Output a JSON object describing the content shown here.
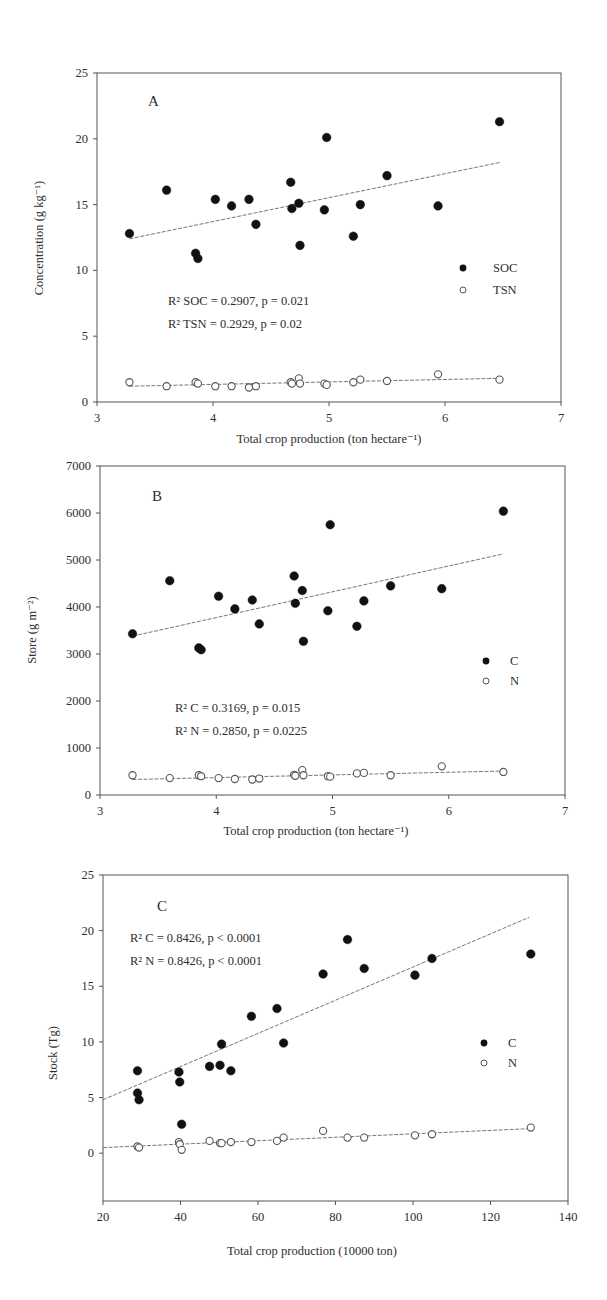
{
  "chart_data": [
    {
      "type": "scatter",
      "panel": "A",
      "title": "",
      "xlabel": "Total crop production (ton hectare⁻¹)",
      "ylabel": "Concentration (g kg⁻¹)",
      "xlim": [
        3,
        7
      ],
      "ylim": [
        0,
        25
      ],
      "xticks": [
        3,
        4,
        5,
        6,
        7
      ],
      "yticks": [
        0,
        5,
        10,
        15,
        20,
        25
      ],
      "grid": false,
      "legend_position": "right-middle",
      "annotations": [
        "R² SOC = 0.2907, p = 0.021",
        "R² TSN = 0.2929, p = 0.02"
      ],
      "series": [
        {
          "name": "SOC",
          "marker": "filled-circle",
          "x": [
            3.28,
            3.6,
            3.85,
            3.87,
            4.02,
            4.16,
            4.31,
            4.37,
            4.67,
            4.68,
            4.74,
            4.75,
            4.96,
            4.98,
            5.21,
            5.27,
            5.5,
            5.94,
            6.47
          ],
          "y": [
            12.8,
            16.1,
            11.3,
            10.9,
            15.4,
            14.9,
            15.4,
            13.5,
            16.7,
            14.7,
            15.1,
            11.9,
            14.6,
            20.1,
            12.6,
            15.0,
            17.2,
            14.9,
            21.3
          ],
          "trendline": {
            "x": [
              3.28,
              6.47
            ],
            "y": [
              12.4,
              18.2
            ]
          }
        },
        {
          "name": "TSN",
          "marker": "open-circle",
          "x": [
            3.28,
            3.6,
            3.85,
            3.87,
            4.02,
            4.16,
            4.31,
            4.37,
            4.67,
            4.68,
            4.74,
            4.75,
            4.96,
            4.98,
            5.21,
            5.27,
            5.5,
            5.94,
            6.47
          ],
          "y": [
            1.5,
            1.2,
            1.5,
            1.4,
            1.2,
            1.2,
            1.1,
            1.2,
            1.5,
            1.4,
            1.8,
            1.4,
            1.4,
            1.3,
            1.5,
            1.7,
            1.6,
            2.1,
            1.7
          ],
          "trendline": {
            "x": [
              3.28,
              6.47
            ],
            "y": [
              1.2,
              1.8
            ]
          }
        }
      ]
    },
    {
      "type": "scatter",
      "panel": "B",
      "title": "",
      "xlabel": "Total crop production (ton hectare⁻¹)",
      "ylabel": "Store (g m⁻²)",
      "xlim": [
        3,
        7
      ],
      "ylim": [
        0,
        7000
      ],
      "xticks": [
        3,
        4,
        5,
        6,
        7
      ],
      "yticks": [
        0,
        1000,
        2000,
        3000,
        4000,
        5000,
        6000,
        7000
      ],
      "grid": false,
      "legend_position": "right-middle",
      "annotations": [
        "R² C = 0.3169, p = 0.015",
        "R² N = 0.2850, p = 0.0225"
      ],
      "series": [
        {
          "name": "C",
          "marker": "filled-circle",
          "x": [
            3.28,
            3.6,
            3.85,
            3.87,
            4.02,
            4.16,
            4.31,
            4.37,
            4.67,
            4.68,
            4.74,
            4.75,
            4.96,
            4.98,
            5.21,
            5.27,
            5.5,
            5.94,
            6.47
          ],
          "y": [
            3430,
            4560,
            3130,
            3090,
            4230,
            3960,
            4150,
            3640,
            4660,
            4080,
            4350,
            3270,
            3920,
            5750,
            3590,
            4130,
            4450,
            4390,
            6040
          ],
          "trendline": {
            "x": [
              3.28,
              6.47
            ],
            "y": [
              3380,
              5130
            ]
          }
        },
        {
          "name": "N",
          "marker": "open-circle",
          "x": [
            3.28,
            3.6,
            3.85,
            3.87,
            4.02,
            4.16,
            4.31,
            4.37,
            4.67,
            4.68,
            4.74,
            4.75,
            4.96,
            4.98,
            5.21,
            5.27,
            5.5,
            5.94,
            6.47
          ],
          "y": [
            420,
            360,
            420,
            400,
            360,
            340,
            330,
            350,
            430,
            410,
            530,
            420,
            400,
            390,
            460,
            470,
            420,
            610,
            490
          ],
          "trendline": {
            "x": [
              3.28,
              6.47
            ],
            "y": [
              330,
              510
            ]
          }
        }
      ]
    },
    {
      "type": "scatter",
      "panel": "C",
      "title": "",
      "xlabel": "Total crop production (10000 ton)",
      "ylabel": "Stock (Tg)",
      "xlim": [
        20,
        140
      ],
      "ylim": [
        -4.3,
        25
      ],
      "xticks": [
        20,
        40,
        60,
        80,
        100,
        120,
        140
      ],
      "yticks": [
        0,
        5,
        10,
        15,
        20,
        25
      ],
      "grid": false,
      "legend_position": "right-middle",
      "annotations": [
        "R² C = 0.8426, p < 0.0001",
        "R² N = 0.8426, p < 0.0001"
      ],
      "series": [
        {
          "name": "C",
          "marker": "filled-circle",
          "x": [
            28.9,
            28.9,
            29.3,
            39.6,
            39.8,
            40.3,
            47.5,
            50.2,
            50.6,
            53.0,
            58.3,
            64.9,
            66.6,
            76.8,
            83.1,
            87.4,
            100.5,
            104.9,
            130.4
          ],
          "y": [
            7.4,
            5.4,
            4.8,
            7.3,
            6.4,
            2.6,
            7.8,
            7.9,
            9.8,
            7.4,
            12.3,
            13.0,
            9.9,
            16.1,
            19.2,
            16.6,
            16.0,
            17.5,
            17.9
          ],
          "trendline": {
            "x": [
              20,
              130
            ],
            "y": [
              4.8,
              21.2
            ]
          }
        },
        {
          "name": "N",
          "marker": "open-circle",
          "x": [
            28.9,
            29.3,
            39.6,
            39.8,
            40.3,
            47.5,
            50.2,
            50.6,
            53.0,
            58.3,
            64.9,
            66.6,
            76.8,
            83.1,
            87.4,
            100.5,
            104.9,
            130.4
          ],
          "y": [
            0.6,
            0.5,
            1.0,
            0.8,
            0.3,
            1.1,
            0.9,
            0.9,
            1.0,
            1.0,
            1.1,
            1.4,
            2.0,
            1.4,
            1.4,
            1.6,
            1.7,
            2.3
          ],
          "trendline": {
            "x": [
              20,
              130
            ],
            "y": [
              0.5,
              2.2
            ]
          }
        }
      ]
    }
  ],
  "panels": {
    "A": {
      "letter": "A",
      "annot1": "R² SOC = 0.2907, p = 0.021",
      "annot2": "R² TSN = 0.2929, p = 0.02",
      "legend1": "SOC",
      "legend2": "TSN",
      "xlabel": "Total crop production (ton hectare⁻¹)",
      "ylabel": "Concentration (g kg⁻¹)"
    },
    "B": {
      "letter": "B",
      "annot1": "R² C = 0.3169, p = 0.015",
      "annot2": "R² N = 0.2850, p = 0.0225",
      "legend1": "C",
      "legend2": "N",
      "xlabel": "Total crop production (ton hectare⁻¹)",
      "ylabel": "Store (g m⁻²)"
    },
    "C": {
      "letter": "C",
      "annot1": "R² C = 0.8426, p < 0.0001",
      "annot2": "R² N = 0.8426, p < 0.0001",
      "legend1": "C",
      "legend2": "N",
      "xlabel": "Total crop production (10000 ton)",
      "ylabel": "Stock (Tg)"
    }
  },
  "colors": {
    "axis": "#555555",
    "filled_marker": "#111111",
    "open_marker_stroke": "#555555",
    "trendline": "#777777"
  }
}
